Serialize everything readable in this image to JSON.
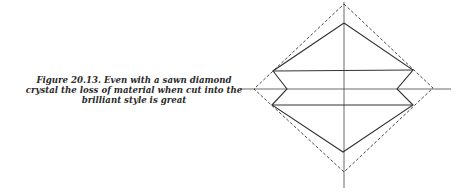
{
  "figure": {
    "caption_lines": [
      "Figure 20.13. Even with a sawn diamond",
      "crystal the loss of material when cut into the",
      "brilliant style is great"
    ]
  },
  "diagram": {
    "stroke_color": "#333333",
    "dashed_outline": "sawn crystal (octahedron half)",
    "solid_outline": "brilliant cut profile"
  }
}
